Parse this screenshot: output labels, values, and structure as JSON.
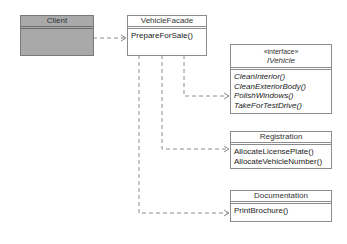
{
  "diagram": {
    "type": "UML class diagram (Facade pattern)",
    "classes": [
      {
        "id": "client",
        "name": "Client",
        "stereotype": null,
        "operations": []
      },
      {
        "id": "facade",
        "name": "VehicleFacade",
        "stereotype": null,
        "operations": [
          "PrepareForSale()"
        ]
      },
      {
        "id": "ivehicle",
        "name": "IVehicle",
        "stereotype": "«interface»",
        "abstract_ops": true,
        "operations": [
          "CleanInterior()",
          "CleanExteriorBody()",
          "PolishWindows()",
          "TakeForTestDrive()"
        ]
      },
      {
        "id": "registration",
        "name": "Registration",
        "stereotype": null,
        "operations": [
          "AllocateLicensePlate()",
          "AllocateVehicleNumber()"
        ]
      },
      {
        "id": "documentation",
        "name": "Documentation",
        "stereotype": null,
        "operations": [
          "PrintBrochure()"
        ]
      }
    ],
    "dependencies": [
      {
        "from": "client",
        "to": "facade",
        "style": "dashed-open-arrow"
      },
      {
        "from": "facade",
        "to": "ivehicle",
        "style": "dashed-open-arrow"
      },
      {
        "from": "facade",
        "to": "registration",
        "style": "dashed-open-arrow"
      },
      {
        "from": "facade",
        "to": "documentation",
        "style": "dashed-open-arrow"
      }
    ],
    "colors": {
      "client_fill": "#a9a9a9",
      "box_fill": "#ffffff",
      "border": "#8c8c8c",
      "line": "#8c8c8c"
    }
  }
}
